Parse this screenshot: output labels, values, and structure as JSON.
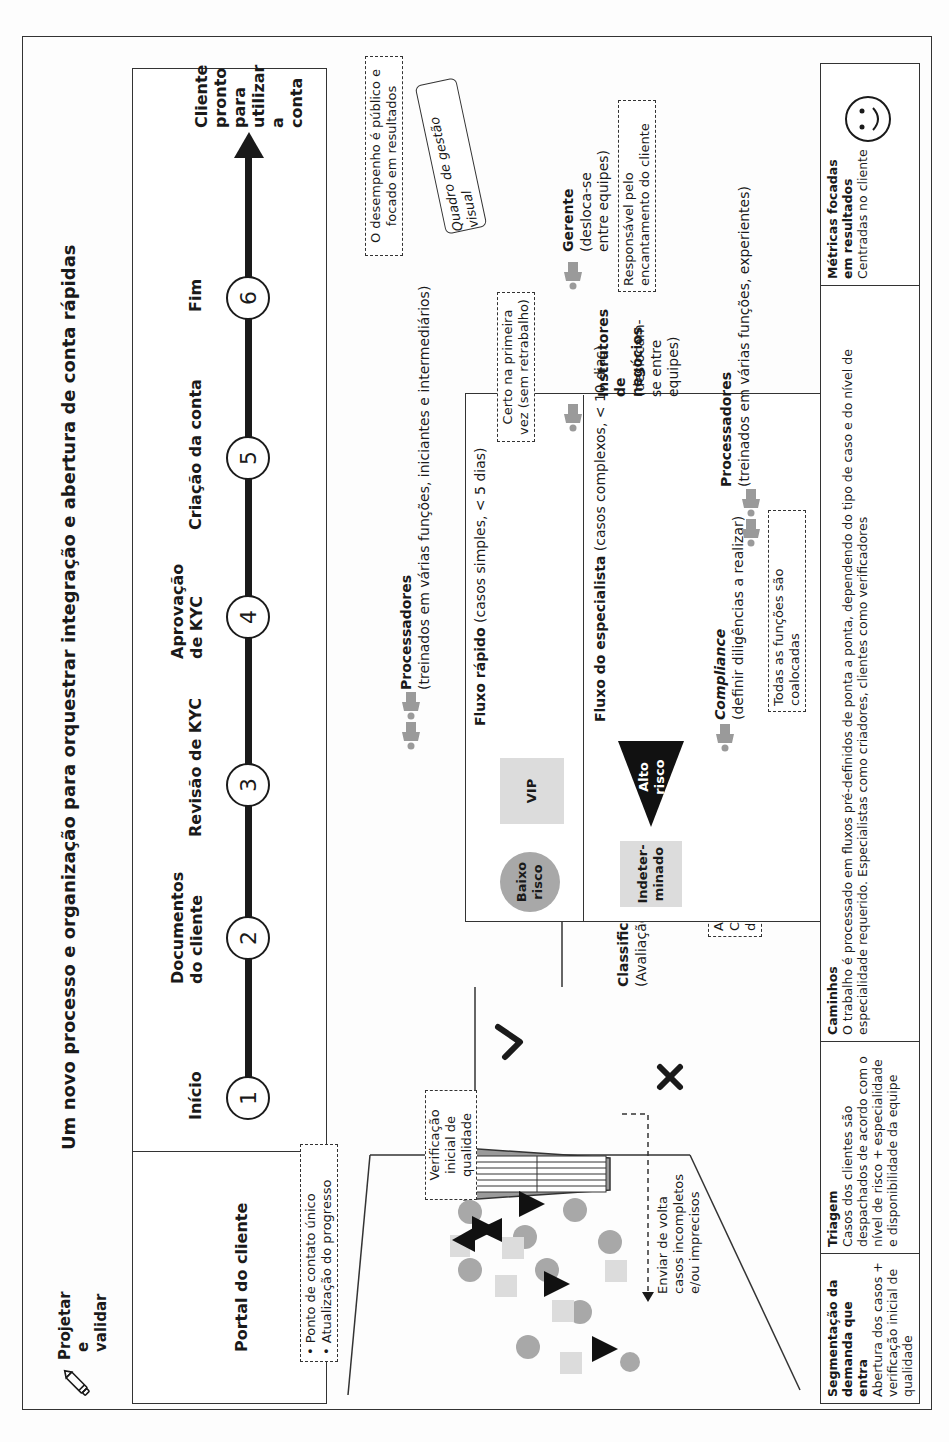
{
  "title": "Um novo processo e organização para orquestrar integração e abertura de conta rápidas",
  "badge": {
    "icon": "pencil-icon",
    "line1": "Projetar",
    "line2": "e validar"
  },
  "portal": {
    "label": "Portal do cliente",
    "notes": [
      "• Ponto de contato único",
      "• Atualização do progresso"
    ]
  },
  "timeline": {
    "steps": [
      {
        "number": "1",
        "label": "Início"
      },
      {
        "number": "2",
        "label": "Documentos do cliente"
      },
      {
        "number": "3",
        "label": "Revisão de KYC"
      },
      {
        "number": "4",
        "label": "Aprovação de KYC"
      },
      {
        "number": "5",
        "label": "Criação da conta"
      },
      {
        "number": "6",
        "label": "Fim"
      }
    ],
    "end_label": "Cliente pronto para utilizar a conta"
  },
  "intake": {
    "quality_check_note": "Verificação inicial de qualidade",
    "send_back": "Enviar de volta casos incompletos e/ou imprecisos",
    "accept_icon": "check-icon",
    "reject_icon": "x-icon"
  },
  "classifier": {
    "title": "Classificador",
    "subtitle": "(Avaliação de risco)",
    "note": "Avaliação de Risco do Cliente (com suporte da TI)"
  },
  "processors_top": {
    "title": "Processadores",
    "subtitle": "(treinados em várias funções, iniciantes e intermediários)"
  },
  "fast_flow": {
    "title": "Fluxo rápido",
    "subtitle": "(casos simples, < 5 dias)",
    "items": [
      "Baixo risco",
      "VIP"
    ]
  },
  "specialist_flow": {
    "title": "Fluxo do especialista",
    "subtitle": "(casos complexos, < 10 dias)",
    "items": [
      "Indeter-minado",
      "Alto risco"
    ]
  },
  "compliance": {
    "title": "Compliance",
    "subtitle": "(definir diligências a realizar)"
  },
  "colocated_note": "Todas as funções são coalocadas",
  "processors_bottom": {
    "title": "Processadores",
    "subtitle": "(treinados em várias funções, experientes)"
  },
  "instructors": {
    "title": "Instrutores de negócios",
    "subtitle": "(deslocam-se entre equipes)"
  },
  "first_time_note": "Certo na primeira vez (sem retrabalho)",
  "performance_note": "O desempenho é público e focado em resultados",
  "visual_board": "Quadro de gestão visual",
  "manager": {
    "title": "Gerente",
    "subtitle": "(desloca-se entre equipes)",
    "note": "Responsável pelo encantamento do cliente"
  },
  "legend": [
    {
      "title": "Segmentação da demanda que entra",
      "text": "Abertura dos casos + verificação inicial de qualidade"
    },
    {
      "title": "Triagem",
      "text": "Casos dos clientes são despachados de acordo com o nível de risco + especialidade e disponibilidade da equipe"
    },
    {
      "title": "Caminhos",
      "text": "O trabalho é processado em fluxos pré-definidos de ponta a ponta, dependendo do tipo de caso e do nível de especialidade requerido. Especialistas como criadores, clientes como verificadores"
    },
    {
      "title": "Métricas focadas em resultados",
      "text": "Centradas no cliente",
      "icon": "smiley-icon"
    }
  ],
  "colors": {
    "ink": "#1a1a1a",
    "person_gray": "#9a9a9a",
    "circle_gray": "#a8a8a8",
    "square_light": "#dcdcdc",
    "triangle": "#111111"
  }
}
